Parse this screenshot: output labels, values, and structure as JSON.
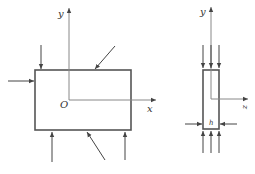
{
  "figure_left": {
    "axis_y_label": "y",
    "axis_x_label": "x",
    "origin_label": "O"
  },
  "figure_right": {
    "axis_y_label": "y",
    "axis_z_label": "z",
    "width_label": "h"
  },
  "colors": {
    "line": "#555555",
    "axis": "#888888",
    "text": "#333333"
  }
}
